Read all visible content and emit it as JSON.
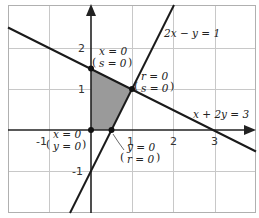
{
  "diagram": {
    "colors": {
      "grid": "#c8c8c8",
      "frame": "#b0b0b0",
      "axis": "#222222",
      "line": "#1a1a1a",
      "region": "#9a9a9a",
      "point": "#111111"
    },
    "axes": {
      "x_ticks": [
        "-1",
        "1",
        "2",
        "3"
      ],
      "y_ticks": [
        "2",
        "1",
        "-1"
      ]
    },
    "lines": [
      {
        "equation": "2x − y = 1"
      },
      {
        "equation": "x + 2y = 3"
      }
    ],
    "vertices": [
      {
        "coords": [
          0,
          1.5
        ],
        "label_top": "x = 0",
        "label_bottom": "s = 0"
      },
      {
        "coords": [
          1,
          1
        ],
        "label_top": "r = 0",
        "label_bottom": "s = 0"
      },
      {
        "coords": [
          0,
          0
        ],
        "label_top": "x = 0",
        "label_bottom": "y = 0"
      },
      {
        "coords": [
          0.5,
          0
        ],
        "label_top": "y = 0",
        "label_bottom": "r = 0"
      }
    ]
  }
}
